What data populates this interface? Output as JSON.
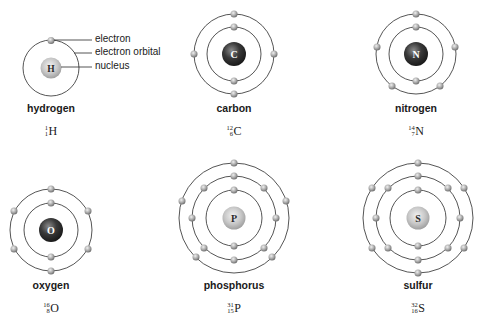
{
  "legend": {
    "electron": "electron",
    "orbital": "electron orbital",
    "nucleus": "nucleus"
  },
  "colors": {
    "orbital_line": "#2a2a2a",
    "electron": "#a8a8a8",
    "nucleus_light": "#c8c8c8",
    "nucleus_dark": "#3a3a3a"
  },
  "atoms": [
    {
      "name": "hydrogen",
      "symbol": "H",
      "mass": "1",
      "number": "1",
      "shells": [
        1
      ],
      "nucleus_style": "light"
    },
    {
      "name": "carbon",
      "symbol": "C",
      "mass": "12",
      "number": "6",
      "shells": [
        2,
        4
      ],
      "nucleus_style": "dark"
    },
    {
      "name": "nitrogen",
      "symbol": "N",
      "mass": "14",
      "number": "7",
      "shells": [
        2,
        5
      ],
      "nucleus_style": "dark"
    },
    {
      "name": "oxygen",
      "symbol": "O",
      "mass": "16",
      "number": "8",
      "shells": [
        2,
        6
      ],
      "nucleus_style": "dark"
    },
    {
      "name": "phosphorus",
      "symbol": "P",
      "mass": "31",
      "number": "15",
      "shells": [
        2,
        8,
        5
      ],
      "nucleus_style": "light"
    },
    {
      "name": "sulfur",
      "symbol": "S",
      "mass": "32",
      "number": "16",
      "shells": [
        2,
        8,
        6
      ],
      "nucleus_style": "light"
    }
  ]
}
